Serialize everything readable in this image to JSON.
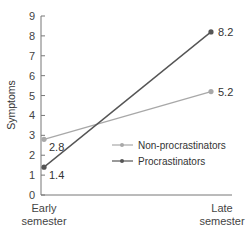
{
  "chart_data": {
    "type": "line",
    "title": "",
    "xlabel": "",
    "ylabel": "Symptoms",
    "categories": [
      "Early semester",
      "Late semester"
    ],
    "category_lines": [
      [
        "Early",
        "semester"
      ],
      [
        "Late",
        "semester"
      ]
    ],
    "ylim": [
      0,
      9
    ],
    "yticks": [
      "0",
      "1",
      "2",
      "3",
      "4",
      "5",
      "6",
      "7",
      "8",
      "9"
    ],
    "grid": false,
    "legend_position": "center-right",
    "series": [
      {
        "name": "Non-procrastinators",
        "values": [
          2.8,
          5.2
        ],
        "labels": [
          "2.8",
          "5.2"
        ],
        "color": "#a8a8a8"
      },
      {
        "name": "Procrastinators",
        "values": [
          1.4,
          8.2
        ],
        "labels": [
          "1.4",
          "8.2"
        ],
        "color": "#555555"
      }
    ]
  }
}
